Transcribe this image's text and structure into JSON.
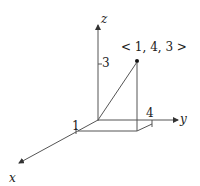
{
  "diagram": {
    "type": "3d-vector-plot",
    "axes": {
      "x": {
        "label": "x"
      },
      "y": {
        "label": "y"
      },
      "z": {
        "label": "z"
      }
    },
    "vector": {
      "components": [
        1,
        4,
        3
      ],
      "label": "< 1, 4, 3 >"
    },
    "ticks": {
      "x": "1",
      "y": "4",
      "z": "3"
    },
    "colors": {
      "line": "#555555",
      "text": "#222222",
      "point": "#111111"
    }
  }
}
